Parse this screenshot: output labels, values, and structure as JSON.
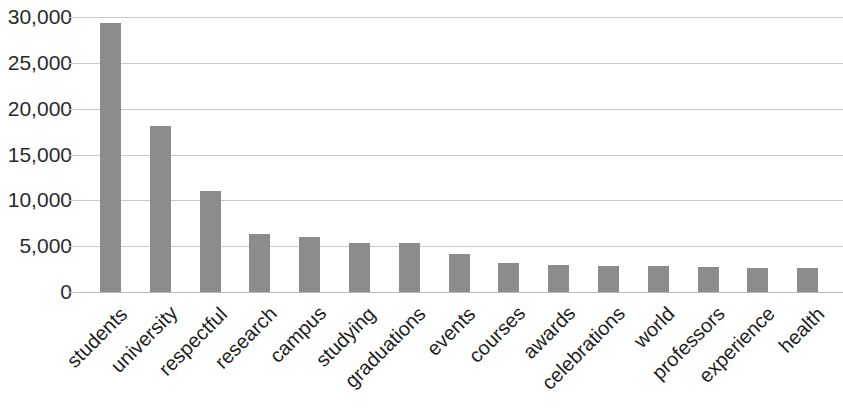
{
  "chart_data": {
    "type": "bar",
    "title": "",
    "subtitle": "",
    "xlabel": "",
    "ylabel": "",
    "grid": true,
    "legend": "none",
    "bar_color": "#8c8c8c",
    "gridline_color": "#c9c9c9",
    "ylim": [
      0,
      30000
    ],
    "ytick_labels": [
      "30,000",
      "25,000",
      "20,000",
      "15,000",
      "10,000",
      "5,000",
      "0"
    ],
    "ytick_values": [
      30000,
      25000,
      20000,
      15000,
      10000,
      5000,
      0
    ],
    "categories": [
      "students",
      "university",
      "respectful",
      "research",
      "campus",
      "studying",
      "graduations",
      "events",
      "courses",
      "awards",
      "celebrations",
      "world",
      "professors",
      "experience",
      "health"
    ],
    "values": [
      29300,
      18100,
      11000,
      6300,
      6000,
      5300,
      5300,
      4100,
      3200,
      3000,
      2800,
      2800,
      2700,
      2600,
      2600
    ]
  }
}
